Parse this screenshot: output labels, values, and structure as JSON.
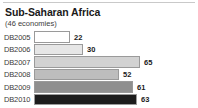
{
  "header": {
    "title": "Sub-Saharan Africa",
    "subtitle": "(46 economies)"
  },
  "colors": {
    "rule": "#c9c9c9",
    "border": "#9a9a9a",
    "title_text": "#1a1a1a",
    "label_text": "#3a3a3a",
    "value_text": "#1a1a1a",
    "background": "#ffffff"
  },
  "chart_data": {
    "type": "bar",
    "orientation": "horizontal",
    "title": "Sub-Saharan Africa",
    "subtitle": "(46 economies)",
    "xlabel": "",
    "ylabel": "",
    "xlim": [
      0,
      70
    ],
    "grid": false,
    "legend": "none",
    "data_labels": true,
    "categories": [
      "DB2005",
      "DB2006",
      "DB2007",
      "DB2008",
      "DB2009",
      "DB2010"
    ],
    "values": [
      22,
      30,
      65,
      52,
      61,
      63
    ],
    "bar_colors": [
      "#ffffff",
      "#e6e6e6",
      "#d2d2d2",
      "#bdbdbd",
      "#8f8f8f",
      "#1c1c1c"
    ],
    "bars": [
      {
        "label": "DB2005",
        "value": 22,
        "value_text": "22",
        "fill": "#ffffff"
      },
      {
        "label": "DB2006",
        "value": 30,
        "value_text": "30",
        "fill": "#e6e6e6"
      },
      {
        "label": "DB2007",
        "value": 65,
        "value_text": "65",
        "fill": "#d2d2d2"
      },
      {
        "label": "DB2008",
        "value": 52,
        "value_text": "52",
        "fill": "#bdbdbd"
      },
      {
        "label": "DB2009",
        "value": 61,
        "value_text": "61",
        "fill": "#8f8f8f"
      },
      {
        "label": "DB2010",
        "value": 63,
        "value_text": "63",
        "fill": "#1c1c1c"
      }
    ]
  }
}
